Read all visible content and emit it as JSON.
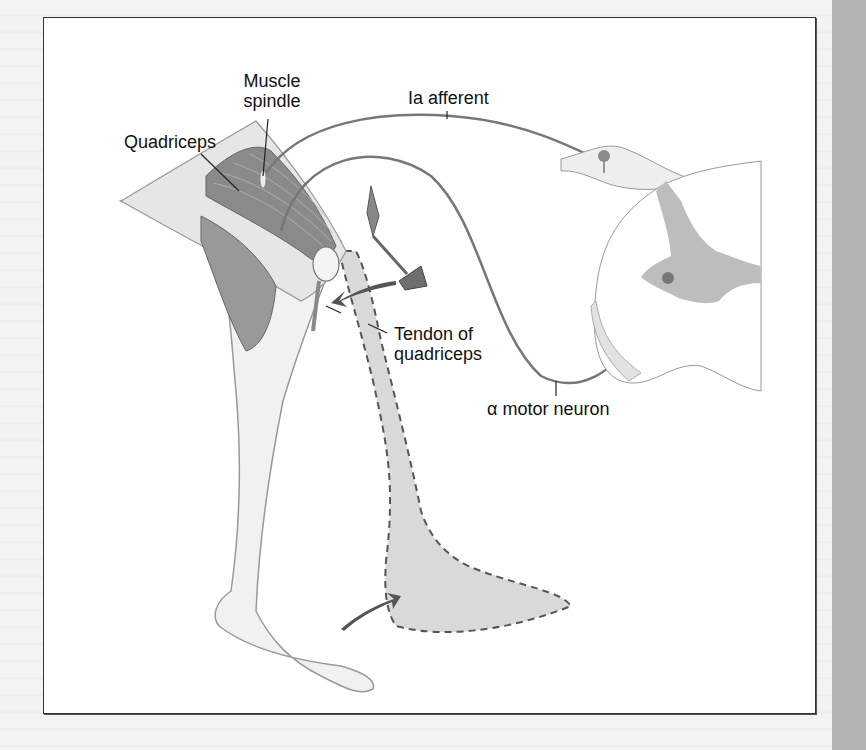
{
  "figure": {
    "labels": {
      "muscle_spindle_line1": "Muscle",
      "muscle_spindle_line2": "spindle",
      "quadriceps": "Quadriceps",
      "ia_afferent": "Ia afferent",
      "tendon_line1": "Tendon of",
      "tendon_line2": "quadriceps",
      "alpha_motor_neuron": "α motor neuron"
    },
    "colors": {
      "nerve": "#777777",
      "muscle": "#8a8a8a",
      "gray_matter": "#bdbdbd",
      "leg_fill": "#ececec",
      "extended_leg_fill": "#d8d8d8",
      "arrow": "#555555",
      "frame": "#333333",
      "side_strip": "#b3b3b1"
    }
  }
}
